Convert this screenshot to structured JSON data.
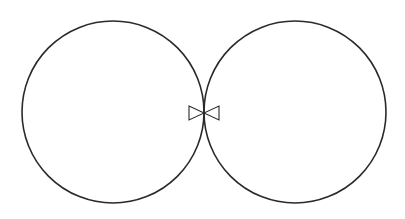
{
  "diagram": {
    "stroke_color": "#2a2a2a",
    "background_color": "#ffffff",
    "left_circle": {
      "cx": 113,
      "cy": 112,
      "r": 91
    },
    "right_circle": {
      "cx": 295,
      "cy": 112,
      "r": 91
    },
    "bowtie": {
      "cx": 204,
      "cy": 113,
      "half_width": 15,
      "half_height": 7
    }
  }
}
